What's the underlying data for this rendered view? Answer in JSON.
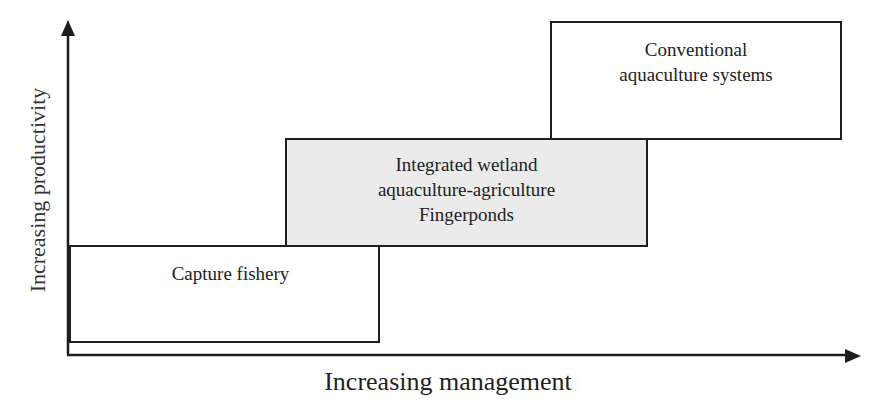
{
  "diagram": {
    "type": "step-box-diagram",
    "x_axis": {
      "label": "Increasing management"
    },
    "y_axis": {
      "label": "Increasing productivity"
    },
    "boxes": [
      {
        "id": "capture",
        "lines": [
          "Capture fishery"
        ],
        "fill": "#ffffff"
      },
      {
        "id": "integrated",
        "lines": [
          "Integrated wetland",
          "aquaculture-agriculture",
          "Fingerponds"
        ],
        "fill": "#ebebeb"
      },
      {
        "id": "conventional",
        "lines": [
          "Conventional",
          "aquaculture systems"
        ],
        "fill": "#ffffff"
      }
    ]
  },
  "colors": {
    "line": "#1e1e1e",
    "highlight_fill": "#ebebeb",
    "background": "#ffffff"
  }
}
